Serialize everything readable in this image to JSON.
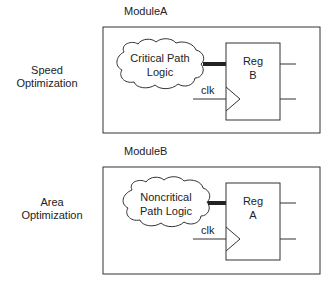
{
  "modules": [
    {
      "name": "ModuleA",
      "side_label_line1": "Speed",
      "side_label_line2": "Optimization",
      "logic_line1": "Critical Path",
      "logic_line2": "Logic",
      "reg_line1": "Reg",
      "reg_line2": "B",
      "clk_label": "clk"
    },
    {
      "name": "ModuleB",
      "side_label_line1": "Area",
      "side_label_line2": "Optimization",
      "logic_line1": "Noncritical",
      "logic_line2": "Path Logic",
      "reg_line1": "Reg",
      "reg_line2": "A",
      "clk_label": "clk"
    }
  ],
  "colors": {
    "stroke": "#333333",
    "background": "#ffffff"
  }
}
